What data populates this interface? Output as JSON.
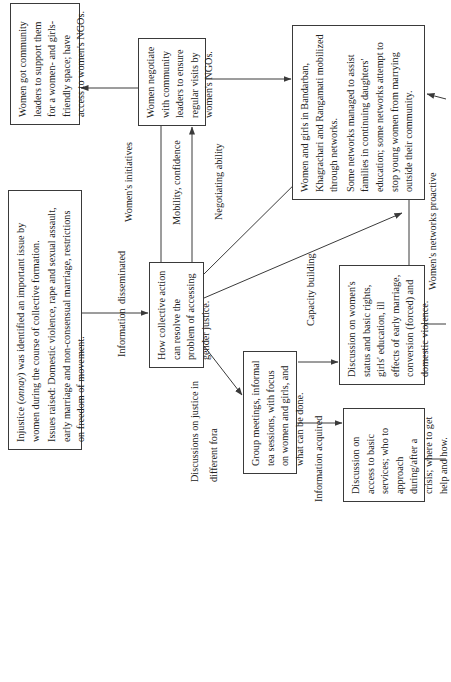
{
  "diagram": {
    "orientation": "rotated 90deg counter-clockwise (text reads bottom to top)",
    "boxes": {
      "community_leaders_support": {
        "lines": [
          "Women got community leaders to support them for a women- and girls-friendly space; have access to women's NGOs."
        ]
      },
      "negotiate_visits": {
        "lines": [
          "Women negotiate with community leaders to ensure regular visits by women's NGOs."
        ]
      },
      "networks_mobilized": {
        "para1": "Women and girls in Bandarban, Khagrachari and Rangamati mobilized through networks.",
        "para2": "Some networks managed to assist families in continuing daughters' education; some networks attempt to stop young women from marrying outside their community."
      },
      "injustice_identified": {
        "para1_pre": "Injustice (",
        "para1_term": "onnay",
        "para1_post": ") was identified an important issue by women during the course of collective formation.",
        "para2": "Issues raised: Domestic violence, rape and sexual assault, early marriage and non-consensual marriage, restrictions on freedom of movement."
      },
      "collective_action": {
        "text": "How collective action can resolve the problem of accessing gender justice."
      },
      "group_meetings": {
        "text": "Group meetings, informal tea sessions, with focus on women and girls, and what can be done."
      },
      "discussion_status_rights": {
        "text": "Discussion on women's status and basic rights, girls' education, ill effects of early marriage, conversion (forced) and domestic violence."
      },
      "discussion_basic_services": {
        "text": "Discussion on access to basic services; who to approach during/after a crisis; where to get help and how."
      }
    },
    "edge_labels": {
      "womens_initiatives": "Women's initiatives",
      "mobility_confidence": "Mobility, confidence",
      "negotiating_ability": "Negotiating ability",
      "information": "Information",
      "disseminated": "disseminated",
      "capacity_building": "Capacity building",
      "womens_networks_proactive": "Women's networks proactive",
      "discussions_justice_line1": "Discussions  on justice in",
      "discussions_justice_line2": "different fora",
      "information_acquired": "Information acquired"
    },
    "colors": {
      "line": "#3a3a3a",
      "text": "#222222",
      "background": "#ffffff"
    }
  }
}
